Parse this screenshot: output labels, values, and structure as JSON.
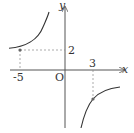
{
  "diagram": {
    "type": "function-graph",
    "axes": {
      "x_label": "x",
      "y_label": "y",
      "origin_label": "O"
    },
    "tick_labels": {
      "x_neg": "-5",
      "x_pos": "3",
      "y_pos": "2"
    },
    "curve": "hyperbola y = k/x, branches in quadrants II and IV",
    "points": [
      {
        "x": -5,
        "y": 2
      },
      {
        "x": 3,
        "y": null
      }
    ],
    "colors": {
      "curve": "#333333",
      "axis": "#555555",
      "guide": "#888888"
    }
  }
}
